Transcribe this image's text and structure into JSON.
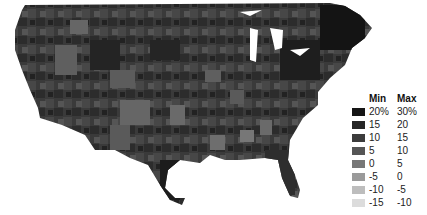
{
  "map": {
    "region": "Contiguous United States",
    "unit": "county/area level shading",
    "fill_style": "grayscale choropleth"
  },
  "legend": {
    "header_min": "Min",
    "header_max": "Max",
    "rows": [
      {
        "min": "20%",
        "max": "30%",
        "color": "#151515"
      },
      {
        "min": "15",
        "max": "20",
        "color": "#262626"
      },
      {
        "min": "10",
        "max": "15",
        "color": "#3c3c3c"
      },
      {
        "min": "5",
        "max": "10",
        "color": "#555555"
      },
      {
        "min": "0",
        "max": "5",
        "color": "#777777"
      },
      {
        "min": "-5",
        "max": "0",
        "color": "#9a9a9a"
      },
      {
        "min": "-10",
        "max": "-5",
        "color": "#bdbdbd"
      },
      {
        "min": "-15",
        "max": "-10",
        "color": "#dcdcdc"
      }
    ]
  }
}
